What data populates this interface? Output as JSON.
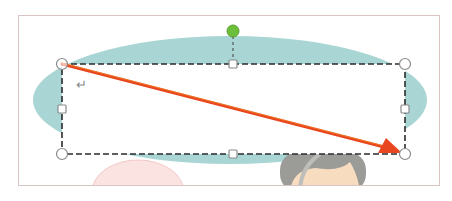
{
  "document": {
    "paragraph_mark": "↵"
  },
  "colors": {
    "ellipse_fill": "#a9d6d4",
    "arrow": "#e8461e",
    "arrow_highlight": "#f5a623",
    "selection_border": "#2b2b2b",
    "rotate_handle": "#6cbf3a",
    "handle_stroke": "#8a8a8a",
    "pink_figure": "#fbe3e1",
    "hair": "#9b9b98",
    "skin": "#f7dcc0",
    "page_border": "#d9c4c4"
  },
  "selection": {
    "x1": 62,
    "y1": 64,
    "x2": 405,
    "y2": 154,
    "rotate_handle": {
      "x": 233,
      "y": 31
    }
  },
  "arrow": {
    "from": {
      "x": 62,
      "y": 64
    },
    "to": {
      "x": 400,
      "y": 152
    }
  }
}
